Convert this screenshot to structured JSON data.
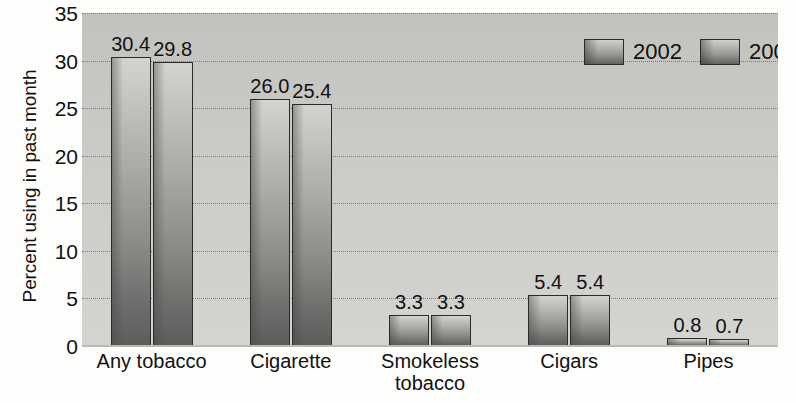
{
  "chart_data": {
    "type": "bar",
    "title": "",
    "xlabel": "",
    "ylabel": "Percent using in past month",
    "ylim": [
      0,
      35
    ],
    "ytick_step": 5,
    "yticks": [
      0,
      5,
      10,
      15,
      20,
      25,
      30,
      35
    ],
    "ytick_labels": [
      "0",
      "5",
      "10",
      "15",
      "20",
      "25",
      "30",
      "35"
    ],
    "categories": [
      "Any tobacco",
      "Cigarette",
      "Smokeless\ntobacco",
      "Cigars",
      "Pipes"
    ],
    "grid": true,
    "grid_style": "dotted horizontal",
    "legend_position": "top-right",
    "series": [
      {
        "name": "2002",
        "values": [
          30.4,
          26.0,
          3.3,
          5.4,
          0.8
        ],
        "value_labels": [
          "30.4",
          "26.0",
          "3.3",
          "5.4",
          "0.8"
        ]
      },
      {
        "name": "2003",
        "values": [
          29.8,
          25.4,
          3.3,
          5.4,
          0.7
        ],
        "value_labels": [
          "29.8",
          "25.4",
          "3.3",
          "5.4",
          "0.7"
        ]
      }
    ]
  },
  "legend": {
    "entries": [
      {
        "label": "2002",
        "swatch": "gradient-gray-bar-swatch"
      },
      {
        "label": "2003",
        "swatch": "gradient-gray-bar-swatch"
      }
    ]
  },
  "colors": {
    "plot_background": "#c9c9c6",
    "bar_fill_top": "#d3d3d0",
    "bar_fill_bottom": "#5c5c5a",
    "bar_border": "#2b2b2b",
    "gridline": "#6e6e6b",
    "text": "#111111",
    "page_background": "#fdfdfc"
  }
}
